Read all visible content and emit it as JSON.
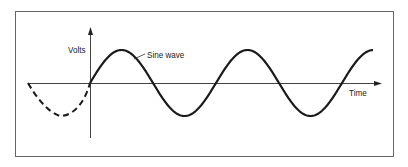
{
  "diagram": {
    "y_axis_label": "Volts",
    "x_axis_label": "Time",
    "curve_label": "Sine wave",
    "colors": {
      "line": "#1a1a1a",
      "axis": "#444444",
      "frame": "#666666",
      "background": "#ffffff"
    },
    "curve": {
      "type": "sine",
      "dashed_portion": "negative half-cycle before origin",
      "solid_portion": "starts at origin, ~2.25 cycles",
      "half_period_px": 63,
      "amplitude_px": 33
    }
  }
}
